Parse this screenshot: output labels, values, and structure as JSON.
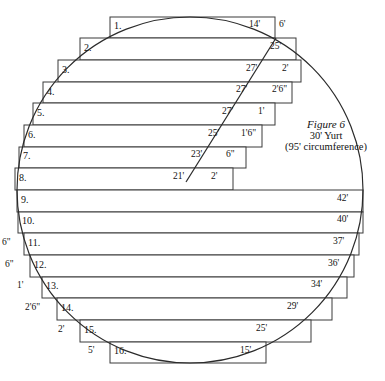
{
  "figure": {
    "caption_title": "Figure 6",
    "caption_line2": "30' Yurt",
    "caption_line3": "(95' circumference)",
    "shape": "circle",
    "colors": {
      "background": "#ffffff",
      "stroke": "#3a3a3a",
      "arc_stroke": "#2b2b2b",
      "text": "#111111"
    }
  },
  "chart_data": {
    "type": "table",
    "columns": [
      "row",
      "right_length",
      "right_offset",
      "left_offset"
    ],
    "rows": [
      {
        "row": "1.",
        "right_length": "14'",
        "right_offset": "6'",
        "left_offset": ""
      },
      {
        "row": "2.",
        "right_length": "25'",
        "right_offset": "",
        "left_offset": ""
      },
      {
        "row": "3.",
        "right_length": "27'",
        "right_offset": "2'",
        "left_offset": ""
      },
      {
        "row": "4.",
        "right_length": "27'",
        "right_offset": "2'6\"",
        "left_offset": ""
      },
      {
        "row": "5.",
        "right_length": "27'",
        "right_offset": "1'",
        "left_offset": ""
      },
      {
        "row": "6.",
        "right_length": "25'",
        "right_offset": "1'6\"",
        "left_offset": ""
      },
      {
        "row": "7.",
        "right_length": "23'",
        "right_offset": "6\"",
        "left_offset": ""
      },
      {
        "row": "8.",
        "right_length": "21'",
        "right_offset": "2'",
        "left_offset": ""
      },
      {
        "row": "9.",
        "right_length": "42'",
        "right_offset": "",
        "left_offset": ""
      },
      {
        "row": "10.",
        "right_length": "40'",
        "right_offset": "",
        "left_offset": ""
      },
      {
        "row": "11.",
        "right_length": "37'",
        "right_offset": "",
        "left_offset": "6\""
      },
      {
        "row": "12.",
        "right_length": "36'",
        "right_offset": "",
        "left_offset": "6\""
      },
      {
        "row": "13.",
        "right_length": "34'",
        "right_offset": "",
        "left_offset": "1'"
      },
      {
        "row": "14.",
        "right_length": "29'",
        "right_offset": "",
        "left_offset": "2'6\""
      },
      {
        "row": "15.",
        "right_length": "25'",
        "right_offset": "",
        "left_offset": "2'"
      },
      {
        "row": "16.",
        "right_length": "15'",
        "right_offset": "",
        "left_offset": "5'"
      }
    ]
  },
  "geometry": {
    "circle": {
      "cx": 190,
      "cy": 190,
      "r": 173
    },
    "seam": {
      "x1": 186,
      "y1": 182,
      "x2": 276,
      "y2": 38
    },
    "strips": [
      {
        "x": 110,
        "y": 17,
        "w": 165,
        "h": 21
      },
      {
        "x": 80,
        "y": 38,
        "w": 216,
        "h": 22
      },
      {
        "x": 58,
        "y": 60,
        "w": 243,
        "h": 22
      },
      {
        "x": 43,
        "y": 82,
        "w": 249,
        "h": 21
      },
      {
        "x": 33,
        "y": 103,
        "w": 242,
        "h": 22
      },
      {
        "x": 24,
        "y": 125,
        "w": 238,
        "h": 22
      },
      {
        "x": 19,
        "y": 147,
        "w": 227,
        "h": 21
      },
      {
        "x": 15,
        "y": 168,
        "w": 218,
        "h": 22
      },
      {
        "x": 17,
        "y": 190,
        "w": 346,
        "h": 22
      },
      {
        "x": 18,
        "y": 212,
        "w": 345,
        "h": 21
      },
      {
        "x": 24,
        "y": 233,
        "w": 335,
        "h": 22
      },
      {
        "x": 30,
        "y": 255,
        "w": 324,
        "h": 22
      },
      {
        "x": 42,
        "y": 277,
        "w": 305,
        "h": 21
      },
      {
        "x": 57,
        "y": 298,
        "w": 275,
        "h": 22
      },
      {
        "x": 80,
        "y": 320,
        "w": 231,
        "h": 22
      },
      {
        "x": 110,
        "y": 342,
        "w": 156,
        "h": 21
      }
    ],
    "num_label_pos": [
      {
        "x": 114,
        "y": 21
      },
      {
        "x": 84,
        "y": 43
      },
      {
        "x": 62,
        "y": 65
      },
      {
        "x": 47,
        "y": 87
      },
      {
        "x": 37,
        "y": 108
      },
      {
        "x": 28,
        "y": 130
      },
      {
        "x": 23,
        "y": 151
      },
      {
        "x": 19,
        "y": 173
      },
      {
        "x": 21,
        "y": 195
      },
      {
        "x": 22,
        "y": 216
      },
      {
        "x": 28,
        "y": 238
      },
      {
        "x": 34,
        "y": 260
      },
      {
        "x": 46,
        "y": 281
      },
      {
        "x": 61,
        "y": 303
      },
      {
        "x": 84,
        "y": 325
      },
      {
        "x": 114,
        "y": 346
      }
    ],
    "right_len_pos": [
      {
        "x": 249,
        "y": 20
      },
      {
        "x": 270,
        "y": 42
      },
      {
        "x": 246,
        "y": 64
      },
      {
        "x": 236,
        "y": 85
      },
      {
        "x": 222,
        "y": 107
      },
      {
        "x": 208,
        "y": 129
      },
      {
        "x": 191,
        "y": 150
      },
      {
        "x": 173,
        "y": 172
      },
      {
        "x": 337,
        "y": 194
      },
      {
        "x": 337,
        "y": 215
      },
      {
        "x": 333,
        "y": 237
      },
      {
        "x": 328,
        "y": 259
      },
      {
        "x": 311,
        "y": 280
      },
      {
        "x": 287,
        "y": 302
      },
      {
        "x": 256,
        "y": 324
      },
      {
        "x": 240,
        "y": 346
      }
    ],
    "right_off_pos": [
      {
        "x": 279,
        "y": 20
      },
      null,
      {
        "x": 282,
        "y": 64
      },
      {
        "x": 272,
        "y": 85
      },
      {
        "x": 258,
        "y": 107
      },
      {
        "x": 241,
        "y": 129
      },
      {
        "x": 226,
        "y": 150
      },
      {
        "x": 211,
        "y": 172
      },
      null,
      null,
      null,
      null,
      null,
      null,
      null,
      null
    ],
    "left_off_pos": [
      null,
      null,
      null,
      null,
      null,
      null,
      null,
      null,
      null,
      null,
      {
        "x": 2,
        "y": 238
      },
      {
        "x": 5,
        "y": 260
      },
      {
        "x": 17,
        "y": 281
      },
      {
        "x": 25,
        "y": 303
      },
      {
        "x": 58,
        "y": 325
      },
      {
        "x": 88,
        "y": 346
      }
    ],
    "caption_pos": {
      "x": 270,
      "y": 118,
      "w": 112
    }
  }
}
